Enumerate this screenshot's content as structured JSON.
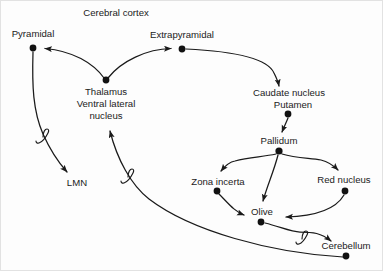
{
  "diagram": {
    "title": "Cerebral cortex",
    "style": {
      "background": "#fdfdfd",
      "stroke": "#1a1a1a",
      "dot_fill": "#111111",
      "text_color": "#1b1b1b",
      "border": "#e2e2e2"
    },
    "nodes": [
      {
        "id": "pyramidal",
        "label": "Pyramidal",
        "label_lines": [
          "Pyramidal"
        ],
        "x": 32,
        "y": 47,
        "label_x": 32,
        "label_y": 36,
        "has_dot": true
      },
      {
        "id": "extrapyramidal",
        "label": "Extrapyramidal",
        "label_lines": [
          "Extrapyramidal"
        ],
        "x": 181,
        "y": 48,
        "label_x": 181,
        "label_y": 37,
        "has_dot": true
      },
      {
        "id": "thalamus",
        "label": "Thalamus Ventral lateral nucleus",
        "label_lines": [
          "Thalamus",
          "Ventral lateral",
          "nucleus"
        ],
        "x": 105,
        "y": 79,
        "label_x": 105,
        "label_y": 94,
        "has_dot": true
      },
      {
        "id": "caudate",
        "label": "Caudate nucleus Putamen",
        "label_lines": [
          "Caudate nucleus",
          "Putamen"
        ],
        "x": 287,
        "y": 113,
        "label_x": 288,
        "label_y": 95,
        "has_dot": true
      },
      {
        "id": "pallidum",
        "label": "Pallidum",
        "label_lines": [
          "Pallidum"
        ],
        "x": 278,
        "y": 150,
        "label_x": 278,
        "label_y": 142,
        "has_dot": true
      },
      {
        "id": "zona_incerta",
        "label": "Zona incerta",
        "label_lines": [
          "Zona incerta"
        ],
        "x": 216,
        "y": 190,
        "label_x": 217,
        "label_y": 183,
        "has_dot": true
      },
      {
        "id": "red_nucleus",
        "label": "Red nucleus",
        "label_lines": [
          "Red nucleus"
        ],
        "x": 344,
        "y": 190,
        "label_x": 343,
        "label_y": 181,
        "has_dot": true
      },
      {
        "id": "olive",
        "label": "Olive",
        "label_lines": [
          "Olive"
        ],
        "x": 260,
        "y": 221,
        "label_x": 261,
        "label_y": 213,
        "has_dot": true
      },
      {
        "id": "cerebellum",
        "label": "Cerebellum",
        "label_lines": [
          "Cerebellum"
        ],
        "x": 345,
        "y": 255,
        "label_x": 345,
        "label_y": 247,
        "has_dot": true
      },
      {
        "id": "lmn",
        "label": "LMN",
        "label_lines": [
          "LMN"
        ],
        "x": 76,
        "y": 182,
        "label_x": 76,
        "label_y": 185,
        "has_dot": false
      }
    ],
    "edges": [
      {
        "id": "thalamus-to-pyramidal",
        "from": "thalamus",
        "to": "pyramidal",
        "arrow": true
      },
      {
        "id": "thalamus-to-extrapyramidal",
        "from": "thalamus",
        "to": "extrapyramidal",
        "arrow": true
      },
      {
        "id": "extrapyramidal-to-caudate",
        "from": "extrapyramidal",
        "to": "caudate",
        "arrow": true
      },
      {
        "id": "caudate-to-pallidum",
        "from": "caudate",
        "to": "pallidum",
        "arrow": true
      },
      {
        "id": "pallidum-to-zona-incerta",
        "from": "pallidum",
        "to": "zona_incerta",
        "arrow": true
      },
      {
        "id": "pallidum-to-olive",
        "from": "pallidum",
        "to": "olive",
        "arrow": true
      },
      {
        "id": "pallidum-to-red-nucleus",
        "from": "pallidum",
        "to": "red_nucleus",
        "arrow": true
      },
      {
        "id": "zona-incerta-to-olive",
        "from": "zona_incerta",
        "to": "olive",
        "arrow": true
      },
      {
        "id": "red-nucleus-to-olive",
        "from": "red_nucleus",
        "to": "olive",
        "arrow": true
      },
      {
        "id": "olive-to-cerebellum",
        "from": "olive",
        "to": "cerebellum",
        "arrow": true,
        "break_symbol": "integral"
      },
      {
        "id": "cerebellum-to-thalamus",
        "from": "cerebellum",
        "to": "thalamus",
        "arrow": true,
        "break_symbol": "integral"
      },
      {
        "id": "pyramidal-to-lmn",
        "from": "pyramidal",
        "to": "lmn",
        "arrow": true,
        "break_symbol": "integral"
      }
    ]
  }
}
